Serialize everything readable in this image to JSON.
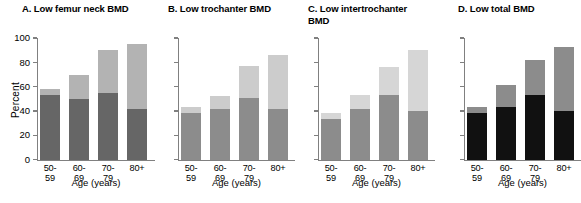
{
  "figure": {
    "xlabel": "Age (years)",
    "ylabel": "Percent",
    "categories": [
      "50-59",
      "60-69",
      "70-79",
      "80+"
    ],
    "yticks": [
      "0",
      "20",
      "40",
      "60",
      "80",
      "100"
    ],
    "colors": {
      "dark_gray": "#666666",
      "medium_gray": "#8c8c8c",
      "light_gray": "#b3b3b3",
      "very_light_gray": "#d6d6d6",
      "black": "#111111",
      "axis": "#808080"
    }
  },
  "panels": [
    {
      "label": "A",
      "title": "A. Low femur neck BMD"
    },
    {
      "label": "B",
      "title": "B. Low trochanter BMD"
    },
    {
      "label": "C",
      "title": "C. Low intertrochanter\n    BMD"
    },
    {
      "label": "D",
      "title": "D. Low total BMD"
    }
  ],
  "chart_data": [
    {
      "type": "bar",
      "title": "A. Low femur neck BMD",
      "xlabel": "Age (years)",
      "ylabel": "Percent",
      "ylim": [
        0,
        100
      ],
      "yticks": [
        0,
        20,
        40,
        60,
        80,
        100
      ],
      "grid": false,
      "legend": "none",
      "stacked": true,
      "categories": [
        "50-59",
        "60-69",
        "70-79",
        "80+"
      ],
      "series": [
        {
          "name": "Osteopenia (lower segment)",
          "color": "#666666",
          "values": [
            53,
            50,
            55,
            42
          ]
        },
        {
          "name": "Osteoporosis (upper segment)",
          "color": "#b3b3b3",
          "values": [
            5,
            20,
            35,
            53
          ]
        }
      ],
      "totals": [
        58,
        70,
        90,
        95
      ]
    },
    {
      "type": "bar",
      "title": "B. Low trochanter BMD",
      "xlabel": "Age (years)",
      "ylabel": "",
      "ylim": [
        0,
        100
      ],
      "yticks": [
        0,
        20,
        40,
        60,
        80,
        100
      ],
      "grid": false,
      "legend": "none",
      "stacked": true,
      "categories": [
        "50-59",
        "60-69",
        "70-79",
        "80+"
      ],
      "series": [
        {
          "name": "Osteopenia (lower segment)",
          "color": "#8c8c8c",
          "values": [
            38,
            42,
            51,
            42
          ]
        },
        {
          "name": "Osteoporosis (upper segment)",
          "color": "#cccccc",
          "values": [
            5,
            10,
            26,
            44
          ]
        }
      ],
      "totals": [
        43,
        52,
        77,
        86
      ]
    },
    {
      "type": "bar",
      "title": "C. Low intertrochanter BMD",
      "xlabel": "Age (years)",
      "ylabel": "",
      "ylim": [
        0,
        100
      ],
      "yticks": [
        0,
        20,
        40,
        60,
        80,
        100
      ],
      "grid": false,
      "legend": "none",
      "stacked": true,
      "categories": [
        "50-59",
        "60-69",
        "70-79",
        "80+"
      ],
      "series": [
        {
          "name": "Osteopenia (lower segment)",
          "color": "#8c8c8c",
          "values": [
            33,
            42,
            53,
            40
          ]
        },
        {
          "name": "Osteoporosis (upper segment)",
          "color": "#d6d6d6",
          "values": [
            5,
            11,
            23,
            50
          ]
        }
      ],
      "totals": [
        38,
        53,
        76,
        90
      ]
    },
    {
      "type": "bar",
      "title": "D. Low total BMD",
      "xlabel": "Age (years)",
      "ylabel": "",
      "ylim": [
        0,
        100
      ],
      "yticks": [
        0,
        20,
        40,
        60,
        80,
        100
      ],
      "grid": false,
      "legend": "none",
      "stacked": true,
      "categories": [
        "50-59",
        "60-69",
        "70-79",
        "80+"
      ],
      "series": [
        {
          "name": "Osteopenia (lower segment)",
          "color": "#111111",
          "values": [
            38,
            43,
            53,
            40
          ]
        },
        {
          "name": "Osteoporosis (upper segment)",
          "color": "#8c8c8c",
          "values": [
            5,
            18,
            29,
            53
          ]
        }
      ],
      "totals": [
        43,
        61,
        82,
        93
      ]
    }
  ]
}
